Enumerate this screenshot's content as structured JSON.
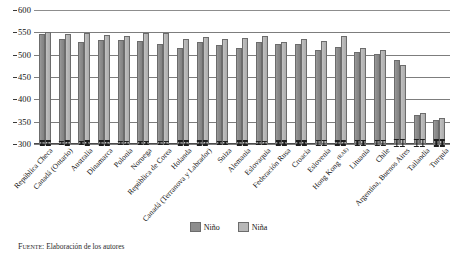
{
  "chart_data": {
    "type": "bar",
    "title": "",
    "subtitle": "",
    "xlabel": "",
    "ylabel": "",
    "ylim": [
      300,
      600
    ],
    "yticks": [
      300,
      350,
      400,
      450,
      500,
      550,
      600
    ],
    "grid": true,
    "legend_position": "bottom",
    "orientation": "vertical",
    "grouping": "paired",
    "error_bars": true,
    "categories": [
      "República Checa",
      "Canadá (Ontario)",
      "Australia",
      "Dinamarca",
      "Polonia",
      "Noruega",
      "República de Corea",
      "Holanda",
      "Canadá (Terranova y Labrador)",
      "Suiza",
      "Alemania",
      "Eslovaquia",
      "Federación Rusa",
      "Croacia",
      "Eslovenia",
      "Hong Kong (RAE)",
      "Lituania",
      "Chile",
      "Argentina, Buenos Aires",
      "Tailandia",
      "Turquía"
    ],
    "series": [
      {
        "name": "Niño",
        "color": "#8d8d8d",
        "values": [
          546,
          534,
          528,
          532,
          533,
          530,
          524,
          514,
          529,
          522,
          516,
          528,
          525,
          523,
          511,
          518,
          505,
          502,
          487,
          364,
          354
        ],
        "errors": [
          6,
          5,
          5,
          6,
          5,
          5,
          5,
          6,
          6,
          5,
          6,
          5,
          6,
          6,
          7,
          6,
          7,
          7,
          9,
          9,
          8
        ]
      },
      {
        "name": "Niña",
        "color": "#b8b8b8",
        "values": [
          551,
          547,
          549,
          545,
          541,
          548,
          549,
          535,
          540,
          536,
          538,
          541,
          528,
          534,
          531,
          541,
          516,
          511,
          477,
          370,
          358
        ],
        "errors": [
          6,
          6,
          6,
          6,
          5,
          5,
          5,
          6,
          6,
          5,
          6,
          5,
          6,
          6,
          7,
          6,
          7,
          7,
          9,
          9,
          8
        ]
      }
    ]
  },
  "legend": {
    "items": [
      {
        "label": "Niño",
        "color": "#8d8d8d"
      },
      {
        "label": "Niña",
        "color": "#b8b8b8"
      }
    ]
  },
  "source": {
    "keyword": "Fuente:",
    "text": " Elaboración de los autores"
  }
}
